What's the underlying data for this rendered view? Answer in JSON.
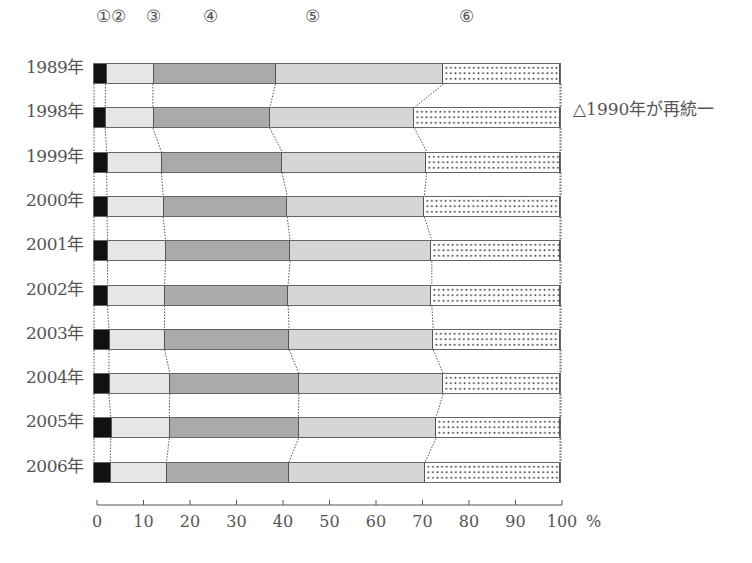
{
  "chart_data": {
    "type": "bar",
    "orientation": "horizontal",
    "stacked": true,
    "normalized_percent": true,
    "title": "",
    "xlabel": "%",
    "ylabel": "",
    "xlim": [
      0,
      100
    ],
    "xticks": [
      0,
      10,
      20,
      30,
      40,
      50,
      60,
      70,
      80,
      90,
      100
    ],
    "categories": [
      "1989年",
      "1998年",
      "1999年",
      "2000年",
      "2001年",
      "2002年",
      "2003年",
      "2004年",
      "2005年",
      "2006年"
    ],
    "series": [
      {
        "name": "①",
        "values": [
          2.7,
          2.6,
          2.9,
          3.0,
          3.1,
          3.1,
          3.4,
          3.4,
          3.8,
          3.7
        ]
      },
      {
        "name": "②",
        "values": [
          10.1,
          10.2,
          11.7,
          12.0,
          12.4,
          12.2,
          11.9,
          13.0,
          12.5,
          12.0
        ]
      },
      {
        "name": "③",
        "values": [
          26.2,
          25.0,
          25.8,
          26.5,
          26.6,
          26.4,
          26.6,
          27.6,
          27.6,
          26.2
        ]
      },
      {
        "name": "④",
        "values": [
          35.9,
          30.9,
          30.9,
          29.3,
          30.3,
          30.7,
          30.8,
          30.8,
          29.4,
          29.1
        ]
      },
      {
        "name": "⑤",
        "values": [
          25.1,
          31.3,
          28.7,
          29.2,
          27.6,
          27.6,
          27.3,
          25.2,
          26.7,
          29.0
        ]
      }
    ],
    "legend": [
      "①",
      "②",
      "③",
      "④",
      "⑤",
      "⑥"
    ],
    "annotations": [
      "△1990年が再統一"
    ],
    "grid": false,
    "connector_lines": "dotted"
  },
  "segment_labels": [
    "①",
    "②",
    "③",
    "④",
    "⑤",
    "⑥"
  ],
  "segment_label_x": [
    103,
    118,
    153,
    210,
    312,
    466
  ],
  "years": [
    "1989年",
    "1998年",
    "1999年",
    "2000年",
    "2001年",
    "2002年",
    "2003年",
    "2004年",
    "2005年",
    "2006年"
  ],
  "axis": {
    "ticks": [
      "0",
      "10",
      "20",
      "30",
      "40",
      "50",
      "60",
      "70",
      "80",
      "90",
      "100"
    ],
    "unit": "%"
  },
  "note": "△1990年が再統一"
}
